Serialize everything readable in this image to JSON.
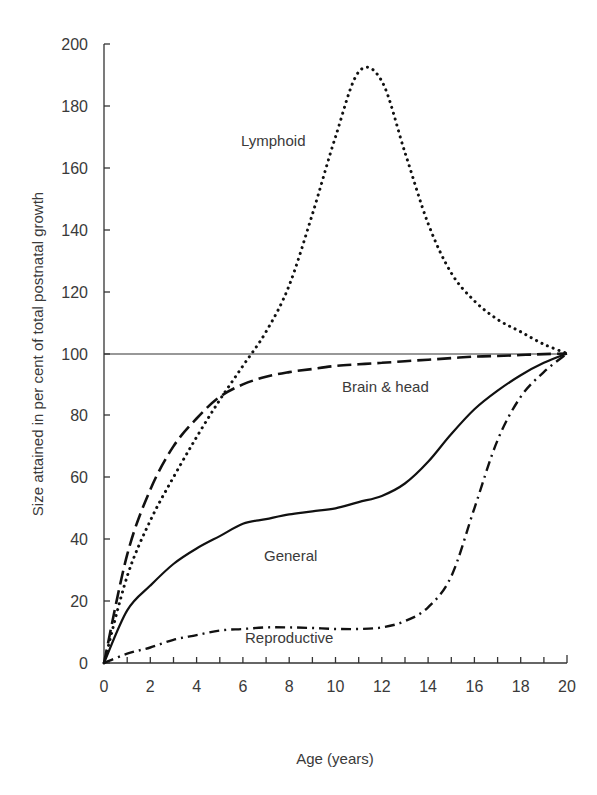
{
  "chart_data": {
    "type": "line",
    "title": "",
    "xlabel": "Age (years)",
    "ylabel": "Size attained in per cent of total postnatal growth",
    "xlim": [
      0,
      20
    ],
    "ylim": [
      0,
      200
    ],
    "x_ticks": [
      0,
      2,
      4,
      6,
      8,
      10,
      12,
      14,
      16,
      18,
      20
    ],
    "x_minor_ticks_every": 1,
    "y_ticks": [
      0,
      20,
      40,
      60,
      80,
      100,
      120,
      140,
      160,
      180,
      200
    ],
    "grid": false,
    "legend": "none (curves labelled inline)",
    "reference_line": {
      "y": 100,
      "style": "solid-thin"
    },
    "x": [
      0,
      1,
      2,
      3,
      4,
      5,
      6,
      7,
      8,
      9,
      10,
      11,
      12,
      13,
      14,
      15,
      16,
      17,
      18,
      19,
      20
    ],
    "series": [
      {
        "name": "Lymphoid",
        "style": "dotted",
        "values": [
          0,
          28,
          46,
          60,
          73,
          85,
          96,
          107,
          122,
          145,
          170,
          191,
          188,
          165,
          142,
          126,
          117,
          111,
          107,
          103,
          100
        ]
      },
      {
        "name": "Brain & head",
        "style": "dashed",
        "values": [
          0,
          35,
          56,
          70,
          79,
          86,
          90,
          92.5,
          94,
          95,
          96,
          96.5,
          97,
          97.5,
          98,
          98.5,
          99,
          99.2,
          99.5,
          99.8,
          100
        ]
      },
      {
        "name": "General",
        "style": "solid",
        "values": [
          0,
          17,
          25,
          32,
          37,
          41,
          45,
          46.5,
          48,
          49,
          50,
          52,
          54,
          58,
          65,
          74,
          82,
          88,
          93,
          97,
          100
        ]
      },
      {
        "name": "Reproductive",
        "style": "dash-dot",
        "values": [
          0,
          3,
          5,
          7.5,
          9,
          10.5,
          11,
          11.5,
          11.5,
          11.3,
          11,
          11,
          11.5,
          13.5,
          18,
          28,
          50,
          72,
          86,
          94,
          100
        ]
      }
    ],
    "annotations": [
      {
        "text": "Lymphoid",
        "x": 7.9,
        "y": 163
      },
      {
        "text": "Brain & head",
        "x": 12.1,
        "y": 93
      },
      {
        "text": "General",
        "x": 9.1,
        "y": 39
      },
      {
        "text": "Reproductive",
        "x": 8.5,
        "y": 15
      }
    ]
  },
  "labels": {
    "xlabel": "Age (years)",
    "ylabel": "Size attained in per cent of total postnatal growth",
    "x_ticks": [
      "0",
      "2",
      "4",
      "6",
      "8",
      "10",
      "12",
      "14",
      "16",
      "18",
      "20"
    ],
    "y_ticks": [
      "0",
      "20",
      "40",
      "60",
      "80",
      "100",
      "120",
      "140",
      "160",
      "180",
      "200"
    ],
    "curves": {
      "lymphoid": "Lymphoid",
      "brain": "Brain & head",
      "general": "General",
      "reproductive": "Reproductive"
    }
  }
}
